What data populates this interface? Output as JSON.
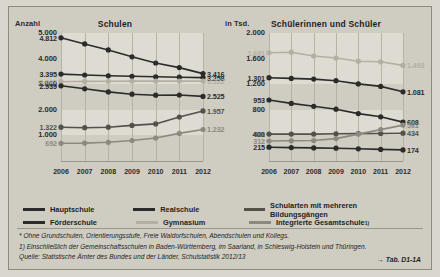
{
  "figure": {
    "left_panel": {
      "title": "Schulen",
      "unit": "Anzahl"
    },
    "right_panel": {
      "title": "Schülerinnen und Schüler",
      "unit": "in Tsd."
    }
  },
  "legend": {
    "items": [
      {
        "label": "Hauptschule",
        "color": "#2b2b2b"
      },
      {
        "label": "Realschule",
        "color": "#2b2b2b"
      },
      {
        "label": "Schularten mit mehreren Bildungsgängen",
        "color": "#555049"
      },
      {
        "label": "Förderschule",
        "color": "#2b2b2b"
      },
      {
        "label": "Gymnasium",
        "color": "#b3afa3"
      },
      {
        "label": "Integrierte Gesamtschule",
        "color": "#8d8980",
        "footnote": "1)"
      }
    ]
  },
  "notes": {
    "line1": "*  Ohne Grundschulen, Orientierungsstufe, Freie Waldorfschulen, Abendschulen und Kollegs.",
    "line2": "1) Einschließlich der Gemeinschaftsschulen in Baden-Württemberg, im Saarland, in Schleswig-Holstein und Thüringen.",
    "line3": "Quelle: Statistische Ämter des Bundes und der Länder, Schulstatistik 2012/13",
    "tabref": "→ Tab. D1-1A"
  },
  "chart_data": [
    {
      "type": "line",
      "title": "Schulen",
      "ylabel": "Anzahl",
      "xlabel": "",
      "ylim": [
        0,
        5000
      ],
      "yticks": [
        "1.000",
        "2.000",
        "3.000",
        "4.000",
        "5.000"
      ],
      "grid": true,
      "legend_position": "below-figure",
      "categories": [
        "2006",
        "2007",
        "2008",
        "2009",
        "2010",
        "2011",
        "2012"
      ],
      "series": [
        {
          "name": "Hauptschule",
          "color": "#2b2b2b",
          "values": [
            4812,
            4575,
            4340,
            4070,
            3830,
            3650,
            3416
          ],
          "label_first": "4.812",
          "label_last": "3.416"
        },
        {
          "name": "Realschule",
          "color": "#2b2b2b",
          "values": [
            3395,
            3360,
            3330,
            3310,
            3290,
            3275,
            3258
          ],
          "label_first": "3.395",
          "label_last": "3.258"
        },
        {
          "name": "Gymnasium",
          "color": "#b3afa3",
          "values": [
            3097,
            3110,
            3115,
            3120,
            3120,
            3122,
            3122
          ],
          "label_first": "3.097",
          "label_last": "3.122"
        },
        {
          "name": "Förderschule",
          "color": "#2b2b2b",
          "values": [
            2939,
            2820,
            2700,
            2610,
            2570,
            2580,
            2525
          ],
          "label_first": "2.939",
          "label_last": "2.525"
        },
        {
          "name": "Schularten mit mehreren Bildungsgängen",
          "color": "#555049",
          "values": [
            1322,
            1300,
            1320,
            1390,
            1450,
            1720,
            1957
          ],
          "label_first": "1.322",
          "label_last": "1.957"
        },
        {
          "name": "Integrierte Gesamtschule",
          "color": "#8d8980",
          "values": [
            692,
            700,
            730,
            800,
            900,
            1080,
            1232
          ],
          "label_first": "692",
          "label_last": "1.232"
        }
      ]
    },
    {
      "type": "line",
      "title": "Schülerinnen und Schüler",
      "ylabel": "in Tsd.",
      "xlabel": "",
      "ylim": [
        0,
        2000
      ],
      "yticks": [
        "400",
        "800",
        "1.200",
        "1.600",
        "2.000"
      ],
      "grid": true,
      "legend_position": "below-figure",
      "categories": [
        "2006",
        "2007",
        "2008",
        "2009",
        "2010",
        "2011",
        "2012"
      ],
      "series": [
        {
          "name": "Gymnasium",
          "color": "#b3afa3",
          "values": [
            1691,
            1700,
            1640,
            1610,
            1560,
            1550,
            1493
          ],
          "label_first": "1.691",
          "label_last": "1.493"
        },
        {
          "name": "Realschule",
          "color": "#2b2b2b",
          "values": [
            1301,
            1290,
            1280,
            1255,
            1205,
            1165,
            1081
          ],
          "label_first": "1.301",
          "label_last": "1.081"
        },
        {
          "name": "Hauptschule",
          "color": "#2b2b2b",
          "values": [
            953,
            900,
            855,
            810,
            740,
            690,
            608
          ],
          "label_first": "953",
          "label_last": "608"
        },
        {
          "name": "Schularten mit mehreren Bildungsgängen",
          "color": "#555049",
          "values": [
            421,
            420,
            420,
            425,
            428,
            430,
            434
          ],
          "label_first": "421",
          "label_last": "434"
        },
        {
          "name": "Integrierte Gesamtschule",
          "color": "#8d8980",
          "values": [
            312,
            315,
            320,
            350,
            420,
            490,
            561
          ],
          "label_first": "312",
          "label_last": "561"
        },
        {
          "name": "Förderschule",
          "color": "#2b2b2b",
          "values": [
            215,
            210,
            205,
            200,
            190,
            182,
            174
          ],
          "label_first": "215",
          "label_last": "174"
        }
      ]
    }
  ]
}
